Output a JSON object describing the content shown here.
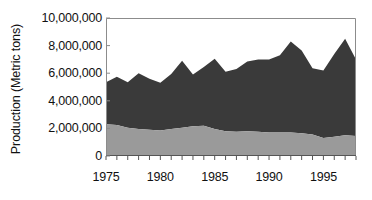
{
  "axes": {
    "y_title": "Production (Metric tons)",
    "y_ticks": [
      "10,000,000",
      "8,000,000",
      "6,000,000",
      "4,000,000",
      "2,000,000",
      "0"
    ],
    "x_ticks": [
      "1975",
      "1980",
      "1985",
      "1990",
      "1995"
    ]
  },
  "colors": {
    "upper_series": "#3a3a3a",
    "lower_series": "#9a9a9a",
    "axis": "#8c8c8c",
    "text": "#111111",
    "background": "#ffffff"
  },
  "chart_data": {
    "type": "area",
    "stacked": true,
    "title": "",
    "xlabel": "",
    "ylabel": "Production (Metric tons)",
    "xlim": [
      1975,
      1998
    ],
    "ylim": [
      0,
      10000000
    ],
    "ytick_values": [
      0,
      2000000,
      4000000,
      6000000,
      8000000,
      10000000
    ],
    "xtick_values": [
      1975,
      1980,
      1985,
      1990,
      1995
    ],
    "grid": false,
    "legend": "none",
    "x": [
      1975,
      1976,
      1977,
      1978,
      1979,
      1980,
      1981,
      1982,
      1983,
      1984,
      1985,
      1986,
      1987,
      1988,
      1989,
      1990,
      1991,
      1992,
      1993,
      1994,
      1995,
      1996,
      1997,
      1998
    ],
    "series": [
      {
        "name": "lower-series",
        "color": "#9a9a9a",
        "values": [
          2300000,
          2250000,
          2050000,
          1950000,
          1900000,
          1850000,
          1950000,
          2050000,
          2150000,
          2200000,
          1950000,
          1800000,
          1750000,
          1800000,
          1750000,
          1700000,
          1700000,
          1700000,
          1650000,
          1550000,
          1300000,
          1400000,
          1500000,
          1450000
        ]
      },
      {
        "name": "upper-series",
        "color": "#3a3a3a",
        "values": [
          3050000,
          3500000,
          3300000,
          4050000,
          3700000,
          3450000,
          4000000,
          4850000,
          3750000,
          4250000,
          5100000,
          4300000,
          4550000,
          5050000,
          5250000,
          5300000,
          5600000,
          6600000,
          6000000,
          4800000,
          4900000,
          6000000,
          7000000,
          5550000
        ]
      }
    ],
    "totals": [
      5350000,
      5750000,
      5350000,
      6000000,
      5600000,
      5300000,
      5950000,
      6900000,
      5900000,
      6450000,
      7050000,
      6100000,
      6300000,
      6850000,
      7000000,
      7000000,
      7300000,
      8300000,
      7650000,
      6350000,
      6200000,
      7400000,
      8500000,
      7000000
    ]
  }
}
